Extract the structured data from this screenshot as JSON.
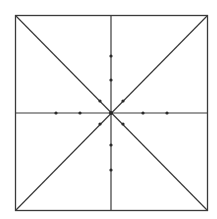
{
  "diagram": {
    "type": "geometric-figure",
    "colors": {
      "background": "#ffffff",
      "line": "#3a3a3a",
      "dot": "#2a2a2a"
    },
    "square": {
      "x1": 15.5,
      "y1": 15.5,
      "x2": 207.5,
      "y2": 210.5
    },
    "center": {
      "x": 111,
      "y": 113
    },
    "lines": [
      {
        "name": "diagonal-tl-br",
        "x1": 15.5,
        "y1": 15.5,
        "x2": 207.5,
        "y2": 210.5
      },
      {
        "name": "diagonal-tr-bl",
        "x1": 207.5,
        "y1": 15.5,
        "x2": 15.5,
        "y2": 210.5
      },
      {
        "name": "vertical-midline",
        "x1": 111,
        "y1": 15.5,
        "x2": 111,
        "y2": 210.5
      },
      {
        "name": "horizontal-midline",
        "x1": 15.5,
        "y1": 113,
        "x2": 207.5,
        "y2": 113
      }
    ],
    "dots": [
      {
        "name": "dot-center",
        "x": 111,
        "y": 113
      },
      {
        "name": "dot-up-1",
        "x": 111,
        "y": 80
      },
      {
        "name": "dot-up-2",
        "x": 111,
        "y": 56
      },
      {
        "name": "dot-down-1",
        "x": 111,
        "y": 145
      },
      {
        "name": "dot-down-2",
        "x": 111,
        "y": 170
      },
      {
        "name": "dot-left-1",
        "x": 80,
        "y": 113
      },
      {
        "name": "dot-left-2",
        "x": 56,
        "y": 113
      },
      {
        "name": "dot-right-1",
        "x": 143,
        "y": 113
      },
      {
        "name": "dot-right-2",
        "x": 167,
        "y": 113
      },
      {
        "name": "dot-diag-ul",
        "x": 100,
        "y": 101
      },
      {
        "name": "dot-diag-ur",
        "x": 123,
        "y": 101
      },
      {
        "name": "dot-diag-ll",
        "x": 100,
        "y": 124
      },
      {
        "name": "dot-diag-lr",
        "x": 123,
        "y": 124
      }
    ]
  }
}
